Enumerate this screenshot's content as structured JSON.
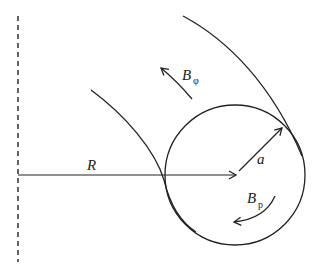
{
  "diagram": {
    "title": "",
    "labels": {
      "major_radius": "R",
      "minor_radius": "a",
      "toroidal_field_main": "B",
      "toroidal_field_sub": "φ",
      "poloidal_field_main": "B",
      "poloidal_field_sub": "p"
    },
    "elements": [
      "symmetry axis (dashed)",
      "major radius vector R",
      "minor cross-section circle",
      "minor radius vector a",
      "helical field line (outer)",
      "helical field line (inner)",
      "toroidal field arrow B_φ",
      "poloidal field arrow B_p"
    ],
    "colors": {
      "stroke": "#222222",
      "background": "#ffffff"
    }
  }
}
